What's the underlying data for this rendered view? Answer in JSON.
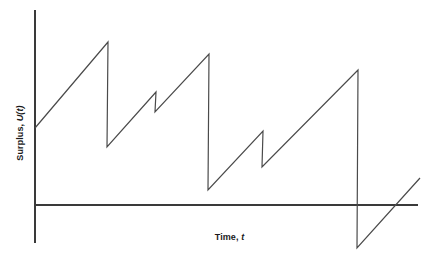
{
  "chart_data": {
    "type": "line",
    "title": "",
    "subtitle": "",
    "xlabel": "Time, t",
    "xlabel_plain": "Time",
    "xlabel_symbol": "t",
    "ylabel": "Surplus, U(t)",
    "ylabel_plain": "Surplus",
    "ylabel_symbol": "U(t)",
    "grid": false,
    "legend": "none",
    "annotations": [],
    "axis_color": "#3a3a3a",
    "line_color": "#4a4a4a",
    "background_color": "#ffffff",
    "axes": {
      "x_axis_start_px": [
        35,
        205
      ],
      "x_axis_end_px": [
        418,
        205
      ],
      "y_axis_start_px": [
        35,
        10
      ],
      "y_axis_end_px": [
        35,
        243
      ],
      "zero_level_px_y": 205,
      "xlim_px": [
        35,
        418
      ],
      "ylim_px": [
        10,
        243
      ]
    },
    "series": [
      {
        "name": "Surplus U(t)",
        "points_px": [
          [
            35,
            128
          ],
          [
            108,
            42
          ],
          [
            107,
            147
          ],
          [
            156,
            92
          ],
          [
            155,
            112
          ],
          [
            209,
            54
          ],
          [
            208,
            190
          ],
          [
            263,
            131
          ],
          [
            262,
            167
          ],
          [
            358,
            70
          ],
          [
            357,
            248
          ],
          [
            420,
            178
          ]
        ]
      }
    ],
    "initial_surplus": 77,
    "ruin_occurs": true,
    "claim_count": 5,
    "claims": [
      {
        "index": 1,
        "time_px": 108,
        "surplus_before": 163,
        "surplus_after": 58,
        "claim_size": 105
      },
      {
        "index": 2,
        "time_px": 156,
        "surplus_before": 113,
        "surplus_after": 93,
        "claim_size": 20
      },
      {
        "index": 3,
        "time_px": 209,
        "surplus_before": 151,
        "surplus_after": 15,
        "claim_size": 136
      },
      {
        "index": 4,
        "time_px": 263,
        "surplus_before": 74,
        "surplus_after": 38,
        "claim_size": 36
      },
      {
        "index": 5,
        "time_px": 358,
        "surplus_before": 135,
        "surplus_after": -43,
        "claim_size": 178
      }
    ]
  }
}
